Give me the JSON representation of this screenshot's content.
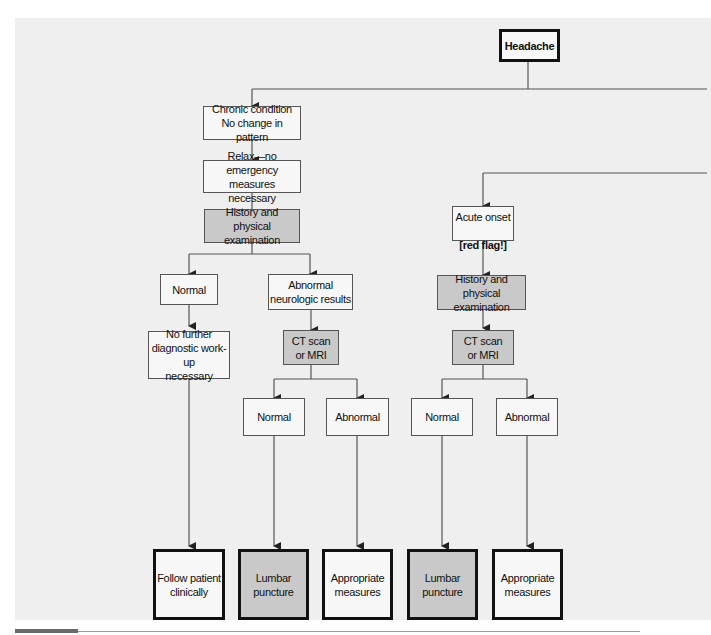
{
  "diagram": {
    "root": {
      "label": "Headache"
    },
    "left_branch": {
      "condition": "Chronic condition\nNo change in pattern",
      "step1": "Relax—no emergency\nmeasures necessary",
      "step2": "History and\nphysical examination",
      "normal": "Normal",
      "abnormal": "Abnormal\nneurologic results",
      "no_further": "No further\ndiagnostic work-up\nnecessary",
      "imaging": "CT scan\nor MRI",
      "imaging_normal": "Normal",
      "imaging_abnormal": "Abnormal",
      "outcome_follow": "Follow patient\nclinically",
      "outcome_lumbar": "Lumbar\npuncture",
      "outcome_measures": "Appropriate\nmeasures"
    },
    "right_branch": {
      "condition_line1": "Acute onset",
      "condition_line2": "[red flag!]",
      "step1": "History and physical\nexamination",
      "imaging": "CT scan\nor MRI",
      "imaging_normal": "Normal",
      "imaging_abnormal": "Abnormal",
      "outcome_lumbar": "Lumbar\npuncture",
      "outcome_measures": "Appropriate\nmeasures"
    },
    "colors": {
      "background": "#efefef",
      "box_fill": "#f7f7f7",
      "shaded_fill": "#c9c9c9",
      "line": "#555555"
    }
  }
}
